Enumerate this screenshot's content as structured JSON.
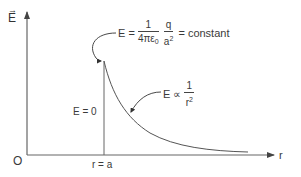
{
  "diagram": {
    "colors": {
      "line": "#555555",
      "text": "#3a3a3a",
      "background": "#ffffff"
    },
    "axes": {
      "y_label": "E",
      "y_label_is_vector": true,
      "x_label": "r",
      "origin_label": "O"
    },
    "markers": {
      "r_equals_a": "r = a"
    },
    "regions": {
      "inside": "E = 0"
    },
    "annotations": {
      "surface_field": {
        "lhs": "E =",
        "frac1_num": "1",
        "frac1_den": "4πε",
        "frac1_den_sub": "0",
        "frac2_num": "q",
        "frac2_den": "a",
        "frac2_den_sup": "2",
        "rhs": "= constant"
      },
      "outside_field": {
        "lhs": "E ∝",
        "frac_num": "1",
        "frac_den": "r",
        "frac_den_sup": "2"
      }
    }
  }
}
